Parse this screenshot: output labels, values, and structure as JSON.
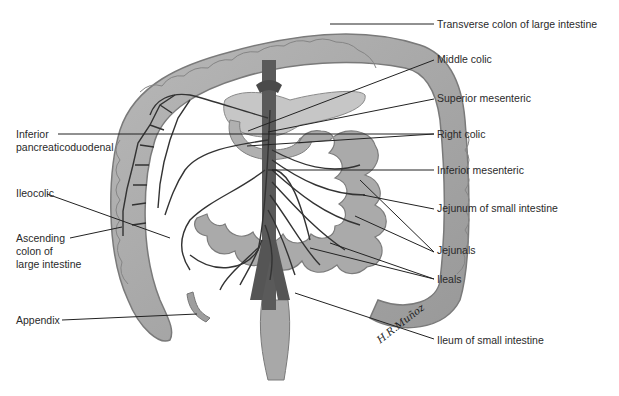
{
  "figure": {
    "colors": {
      "intestine_fill": "#a9a9a9",
      "intestine_edge": "#7a7a7a",
      "vessel": "#3a3a3a",
      "aorta": "#555555",
      "pancreas": "#c4c4c4",
      "leader_line": "#222222",
      "background": "#ffffff"
    },
    "signature": "H.R.Muñoz"
  },
  "labels": {
    "right": [
      {
        "id": "transverse-colon",
        "text": "Transverse colon of large intestine"
      },
      {
        "id": "middle-colic",
        "text": "Middle colic"
      },
      {
        "id": "superior-mesenteric",
        "text": "Superior mesenteric"
      },
      {
        "id": "right-colic",
        "text": "Right colic"
      },
      {
        "id": "inferior-mesenteric",
        "text": "Inferior mesenteric"
      },
      {
        "id": "jejunum",
        "text": "Jejunum of small intestine"
      },
      {
        "id": "jejunals",
        "text": "Jejunals"
      },
      {
        "id": "ileals",
        "text": "Ileals"
      },
      {
        "id": "ileum",
        "text": "Ileum of small intestine"
      }
    ],
    "left": [
      {
        "id": "inferior-pancreaticoduodenal",
        "text": "Inferior\npancreaticoduodenal"
      },
      {
        "id": "ileocolic",
        "text": "Ileocolic"
      },
      {
        "id": "ascending-colon",
        "text": "Ascending\ncolon of\nlarge intestine"
      },
      {
        "id": "appendix",
        "text": "Appendix"
      }
    ]
  }
}
